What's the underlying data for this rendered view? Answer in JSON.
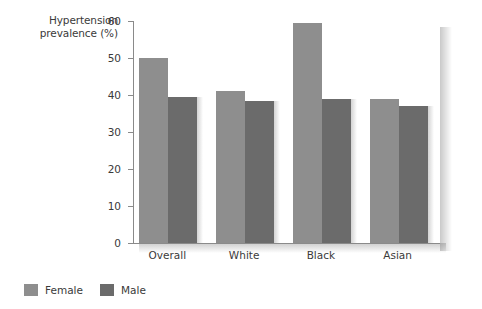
{
  "chart_data": {
    "type": "bar",
    "title": "",
    "xlabel": "",
    "ylabel": "Hypertension prevalence (%)",
    "ylim": [
      0,
      60
    ],
    "yticks": [
      "0",
      "10",
      "20",
      "30",
      "40",
      "50",
      "60"
    ],
    "grid": false,
    "legend_position": "bottom-left",
    "categories": [
      "Overall",
      "White",
      "Black",
      "Asian"
    ],
    "series": [
      {
        "name": "Female",
        "color": "#8e8e8e",
        "values": [
          50,
          41,
          59.5,
          39
        ]
      },
      {
        "name": "Male",
        "color": "#6b6b6b",
        "values": [
          39.5,
          38.5,
          39,
          37
        ]
      }
    ]
  },
  "axis": {
    "y_title_line1": "Hypertension",
    "y_title_line2": "prevalence (%)"
  },
  "legend": {
    "female_label": "Female",
    "male_label": "Male"
  }
}
